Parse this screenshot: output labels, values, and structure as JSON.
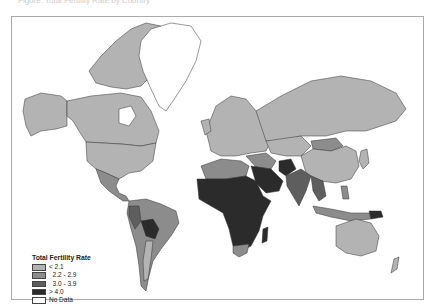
{
  "caption": "Figure: Total Fertility Rate by Country",
  "legend": {
    "title": "Total Fertility Rate",
    "items": [
      {
        "label": "< 2.1",
        "color": "#b3b3b3"
      },
      {
        "label": "  2.2 - 2.9",
        "color": "#8c8c8c"
      },
      {
        "label": "  3.0 - 3.9",
        "color": "#5e5e5e"
      },
      {
        "label": "> 4.0",
        "color": "#2b2b2b"
      },
      {
        "label": "No Data",
        "color": "#ffffff"
      }
    ]
  },
  "colors": {
    "low": "#b3b3b3",
    "mid": "#8c8c8c",
    "high": "#5e5e5e",
    "very_high": "#2b2b2b",
    "no_data": "#ffffff",
    "border": "#333333"
  }
}
